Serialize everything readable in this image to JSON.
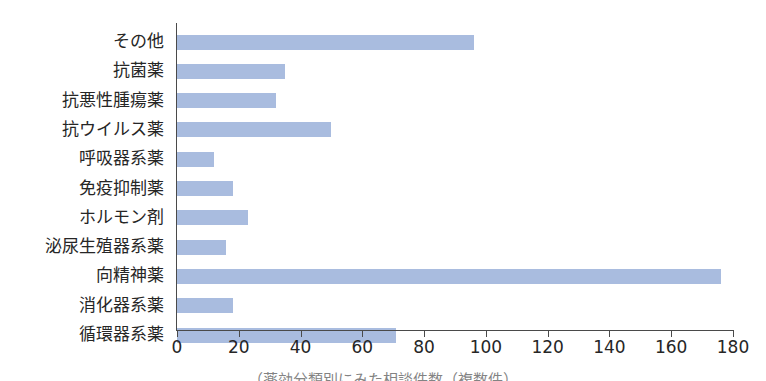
{
  "chart_data": {
    "type": "bar",
    "orientation": "horizontal",
    "title": "",
    "xlabel": "",
    "ylabel": "",
    "xlim": [
      0,
      180
    ],
    "xticks": [
      0,
      20,
      40,
      60,
      80,
      100,
      120,
      140,
      160,
      180
    ],
    "grid": false,
    "legend": false,
    "bar_color": "#a9bcdf",
    "axis_color": "#4a4a4a",
    "text_color": "#262626",
    "background": "#ffffff",
    "categories": [
      "その他",
      "抗菌薬",
      "抗悪性腫瘍薬",
      "抗ウイルス薬",
      "呼吸器系薬",
      "免疫抑制薬",
      "ホルモン剤",
      "泌尿生殖器系薬",
      "向精神薬",
      "消化器系薬",
      "循環器系薬"
    ],
    "values": [
      96,
      35,
      32,
      50,
      12,
      18,
      23,
      16,
      176,
      18,
      71
    ]
  },
  "caption": {
    "text": "（薬効分類別にみた相談件数（複数件）"
  }
}
